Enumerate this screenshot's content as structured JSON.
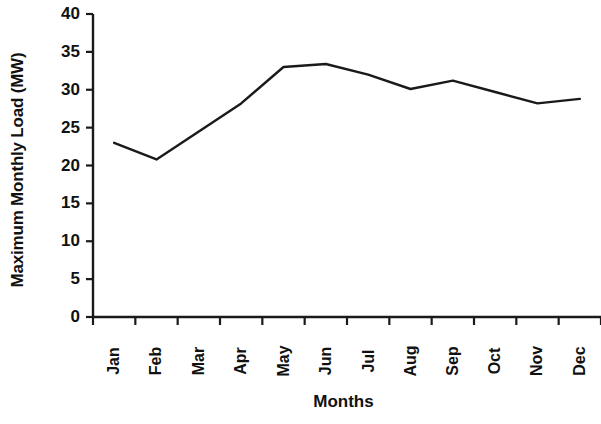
{
  "chart_data": {
    "type": "line",
    "title": "",
    "subtitle": "",
    "xlabel": "Months",
    "ylabel": "Maximum Monthly Load (MW)",
    "categories": [
      "Jan",
      "Feb",
      "Mar",
      "Apr",
      "May",
      "Jun",
      "Jul",
      "Aug",
      "Sep",
      "Oct",
      "Nov",
      "Dec"
    ],
    "values": [
      23,
      20.8,
      24.5,
      28.2,
      33,
      33.4,
      32,
      30.1,
      31.2,
      29.7,
      28.2,
      28.8
    ],
    "series": [
      {
        "name": "Maximum Monthly Load",
        "values": [
          23,
          20.8,
          24.5,
          28.2,
          33,
          33.4,
          32,
          30.1,
          31.2,
          29.7,
          28.2,
          28.8
        ]
      }
    ],
    "ylim": [
      0,
      40
    ],
    "ytick_labels": [
      "0",
      "5",
      "10",
      "15",
      "20",
      "25",
      "30",
      "35",
      "40"
    ],
    "ytick_values": [
      0,
      5,
      10,
      15,
      20,
      25,
      30,
      35,
      40
    ],
    "grid": false,
    "legend": false,
    "legend_position": "none",
    "line_color": "#1a1a1a",
    "markers": false,
    "axis_color": "#1a1a1a",
    "background_color": "#ffffff",
    "xtick_rotation": 90
  }
}
